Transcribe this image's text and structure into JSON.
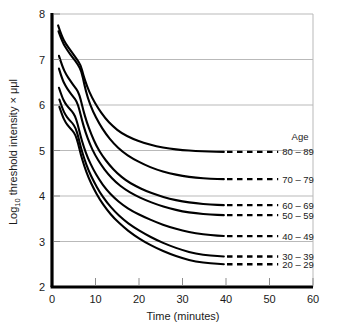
{
  "chart_data": {
    "type": "line",
    "title": "",
    "xlabel": "Time (minutes)",
    "ylabel_main": "Log",
    "ylabel_sub": "10",
    "ylabel_rest": " threshold intensity × μμl",
    "ylabel_full": "Log10 threshold intensity × μμl",
    "xlim": [
      0,
      60
    ],
    "ylim": [
      2,
      8
    ],
    "xticks": [
      0,
      10,
      20,
      30,
      40,
      50,
      60
    ],
    "xtick_labels": [
      "0",
      "10",
      "20",
      "30",
      "40",
      "50",
      "60"
    ],
    "yticks": [
      2,
      3,
      4,
      5,
      6,
      7,
      8
    ],
    "ytick_labels": [
      "2",
      "3",
      "4",
      "5",
      "6",
      "7",
      "8"
    ],
    "grid": "horizontal",
    "gridlines_y": [
      3,
      4,
      5,
      6,
      7,
      8
    ],
    "legend_title": "Age",
    "legend_position": "right",
    "line_color": "#000000",
    "grid_color": "#b9b9b9",
    "axis_color": "#000000",
    "dash_start_x": 40,
    "dash_end_x": 52,
    "series": [
      {
        "name": "80 - 89",
        "label": "80 – 89",
        "plateau": 4.97,
        "start_x": 1.4,
        "start_y": 7.75,
        "points": [
          [
            1.4,
            7.75
          ],
          [
            2.2,
            7.52
          ],
          [
            3.2,
            7.34
          ],
          [
            4.4,
            7.18
          ],
          [
            5.6,
            7.02
          ],
          [
            6.6,
            6.88
          ],
          [
            7.2,
            6.66
          ],
          [
            8.0,
            6.42
          ],
          [
            9.2,
            6.16
          ],
          [
            10.6,
            5.93
          ],
          [
            12.2,
            5.71
          ],
          [
            14.0,
            5.53
          ],
          [
            16.0,
            5.38
          ],
          [
            18.5,
            5.26
          ],
          [
            21.0,
            5.17
          ],
          [
            24.0,
            5.09
          ],
          [
            27.0,
            5.04
          ],
          [
            30.0,
            5.01
          ],
          [
            33.0,
            4.99
          ],
          [
            36.0,
            4.975
          ],
          [
            39.5,
            4.97
          ]
        ]
      },
      {
        "name": "70 - 79",
        "label": "70 – 79",
        "plateau": 4.37,
        "start_x": 1.5,
        "start_y": 7.62,
        "points": [
          [
            1.5,
            7.62
          ],
          [
            2.4,
            7.38
          ],
          [
            3.6,
            7.19
          ],
          [
            4.8,
            7.04
          ],
          [
            5.9,
            6.9
          ],
          [
            6.8,
            6.74
          ],
          [
            7.4,
            6.46
          ],
          [
            8.2,
            6.16
          ],
          [
            9.4,
            5.86
          ],
          [
            10.8,
            5.6
          ],
          [
            12.4,
            5.36
          ],
          [
            14.2,
            5.15
          ],
          [
            16.2,
            4.97
          ],
          [
            18.6,
            4.82
          ],
          [
            21.2,
            4.69
          ],
          [
            24.0,
            4.58
          ],
          [
            27.0,
            4.5
          ],
          [
            30.0,
            4.44
          ],
          [
            33.0,
            4.4
          ],
          [
            36.5,
            4.38
          ],
          [
            39.5,
            4.37
          ]
        ]
      },
      {
        "name": "60 - 69",
        "label": "60 – 69",
        "plateau": 3.8,
        "start_x": 1.6,
        "start_y": 7.08,
        "points": [
          [
            1.6,
            7.08
          ],
          [
            2.4,
            6.84
          ],
          [
            3.3,
            6.66
          ],
          [
            4.3,
            6.52
          ],
          [
            5.2,
            6.4
          ],
          [
            6.0,
            6.3
          ],
          [
            6.6,
            6.12
          ],
          [
            7.2,
            5.88
          ],
          [
            8.0,
            5.62
          ],
          [
            9.0,
            5.36
          ],
          [
            10.2,
            5.1
          ],
          [
            11.6,
            4.88
          ],
          [
            13.2,
            4.68
          ],
          [
            15.0,
            4.5
          ],
          [
            17.0,
            4.34
          ],
          [
            19.2,
            4.22
          ],
          [
            21.6,
            4.11
          ],
          [
            24.2,
            4.02
          ],
          [
            27.0,
            3.94
          ],
          [
            30.0,
            3.88
          ],
          [
            33.0,
            3.84
          ],
          [
            36.5,
            3.81
          ],
          [
            39.5,
            3.8
          ]
        ]
      },
      {
        "name": "50 - 59",
        "label": "50 – 59",
        "plateau": 3.58,
        "start_x": 1.6,
        "start_y": 6.8,
        "points": [
          [
            1.6,
            6.8
          ],
          [
            2.3,
            6.58
          ],
          [
            3.1,
            6.42
          ],
          [
            4.0,
            6.29
          ],
          [
            4.9,
            6.18
          ],
          [
            5.7,
            6.08
          ],
          [
            6.3,
            5.9
          ],
          [
            6.9,
            5.66
          ],
          [
            7.7,
            5.4
          ],
          [
            8.7,
            5.14
          ],
          [
            9.9,
            4.9
          ],
          [
            11.3,
            4.68
          ],
          [
            12.9,
            4.48
          ],
          [
            14.7,
            4.3
          ],
          [
            16.7,
            4.15
          ],
          [
            19.0,
            4.02
          ],
          [
            21.5,
            3.91
          ],
          [
            24.2,
            3.81
          ],
          [
            27.0,
            3.73
          ],
          [
            30.0,
            3.66
          ],
          [
            33.0,
            3.62
          ],
          [
            36.5,
            3.59
          ],
          [
            39.5,
            3.58
          ]
        ]
      },
      {
        "name": "40 - 49",
        "label": "40 – 49",
        "plateau": 3.12,
        "start_x": 1.6,
        "start_y": 6.38,
        "points": [
          [
            1.6,
            6.38
          ],
          [
            2.3,
            6.18
          ],
          [
            3.0,
            6.04
          ],
          [
            3.8,
            5.94
          ],
          [
            4.6,
            5.86
          ],
          [
            5.3,
            5.76
          ],
          [
            5.9,
            5.58
          ],
          [
            6.5,
            5.34
          ],
          [
            7.3,
            5.08
          ],
          [
            8.3,
            4.82
          ],
          [
            9.5,
            4.58
          ],
          [
            10.9,
            4.35
          ],
          [
            12.5,
            4.14
          ],
          [
            14.3,
            3.96
          ],
          [
            16.3,
            3.8
          ],
          [
            18.6,
            3.66
          ],
          [
            21.2,
            3.54
          ],
          [
            24.0,
            3.42
          ],
          [
            27.0,
            3.32
          ],
          [
            30.0,
            3.24
          ],
          [
            33.0,
            3.18
          ],
          [
            36.5,
            3.14
          ],
          [
            39.5,
            3.12
          ]
        ]
      },
      {
        "name": "30 - 39",
        "label": "30 – 39",
        "plateau": 2.67,
        "start_x": 1.7,
        "start_y": 6.12,
        "points": [
          [
            1.7,
            6.12
          ],
          [
            2.4,
            5.92
          ],
          [
            3.1,
            5.78
          ],
          [
            3.9,
            5.68
          ],
          [
            4.7,
            5.6
          ],
          [
            5.4,
            5.5
          ],
          [
            6.0,
            5.32
          ],
          [
            6.6,
            5.08
          ],
          [
            7.4,
            4.82
          ],
          [
            8.4,
            4.56
          ],
          [
            9.6,
            4.32
          ],
          [
            11.0,
            4.08
          ],
          [
            12.6,
            3.86
          ],
          [
            14.4,
            3.66
          ],
          [
            16.4,
            3.48
          ],
          [
            18.7,
            3.32
          ],
          [
            21.3,
            3.17
          ],
          [
            24.1,
            3.03
          ],
          [
            27.0,
            2.91
          ],
          [
            30.0,
            2.81
          ],
          [
            33.0,
            2.73
          ],
          [
            36.5,
            2.69
          ],
          [
            39.5,
            2.67
          ]
        ]
      },
      {
        "name": "20 - 29",
        "label": "20 – 29",
        "plateau": 2.5,
        "start_x": 1.7,
        "start_y": 5.96,
        "points": [
          [
            1.7,
            5.96
          ],
          [
            2.4,
            5.76
          ],
          [
            3.1,
            5.62
          ],
          [
            3.9,
            5.52
          ],
          [
            4.7,
            5.44
          ],
          [
            5.4,
            5.34
          ],
          [
            6.0,
            5.16
          ],
          [
            6.6,
            4.92
          ],
          [
            7.4,
            4.66
          ],
          [
            8.4,
            4.4
          ],
          [
            9.6,
            4.16
          ],
          [
            11.0,
            3.92
          ],
          [
            12.6,
            3.7
          ],
          [
            14.4,
            3.5
          ],
          [
            16.4,
            3.32
          ],
          [
            18.7,
            3.15
          ],
          [
            21.3,
            2.99
          ],
          [
            24.1,
            2.85
          ],
          [
            27.0,
            2.73
          ],
          [
            30.0,
            2.63
          ],
          [
            33.0,
            2.56
          ],
          [
            36.5,
            2.52
          ],
          [
            39.5,
            2.5
          ]
        ]
      }
    ]
  }
}
